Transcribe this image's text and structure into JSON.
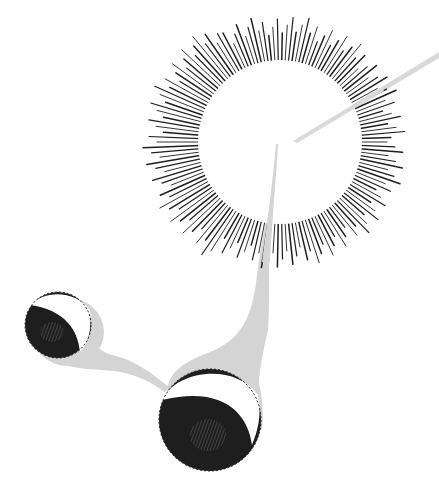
{
  "scene": {
    "title": "Sun with rays and two orbiting spheres",
    "colors": {
      "background": "#ffffff",
      "ink": "#1e1e1e",
      "shadow": "#d4d4d4",
      "highlight": "#ffffff"
    },
    "sun": {
      "cx": 280,
      "cy": 142,
      "inner_r": 82,
      "outer_r": 125,
      "ray_count": 150
    },
    "small_sphere": {
      "cx": 60,
      "cy": 325,
      "r": 33
    },
    "large_sphere": {
      "cx": 210,
      "cy": 420,
      "r": 51
    }
  }
}
